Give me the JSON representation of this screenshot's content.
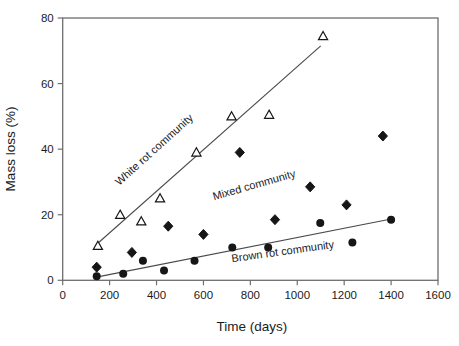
{
  "chart_data": {
    "type": "scatter",
    "title": "",
    "xlabel": "Time (days)",
    "ylabel": "Mass loss (%)",
    "xlim": [
      0,
      1600
    ],
    "ylim": [
      0,
      80
    ],
    "xticks": [
      0,
      200,
      400,
      600,
      800,
      1000,
      1200,
      1400,
      1600
    ],
    "yticks": [
      0,
      20,
      40,
      60,
      80
    ],
    "grid": false,
    "legend_position": "in-plot-rotated-labels",
    "frame_color": "#6e6e6e",
    "marker_color": "#161616",
    "line_color": "#4a4a4a",
    "series": [
      {
        "name": "White rot community",
        "marker": "open-triangle",
        "points": [
          [
            150,
            10.5
          ],
          [
            245,
            20
          ],
          [
            335,
            18
          ],
          [
            415,
            25
          ],
          [
            570,
            39
          ],
          [
            720,
            50
          ],
          [
            880,
            50.5
          ],
          [
            1110,
            74.5
          ]
        ],
        "trendline": [
          [
            145,
            11
          ],
          [
            1100,
            71.5
          ]
        ],
        "label": {
          "text": "White rot community",
          "x": 400,
          "y": 39,
          "rotation": -42
        }
      },
      {
        "name": "Mixed community",
        "marker": "filled-diamond",
        "points": [
          [
            145,
            4
          ],
          [
            295,
            8.5
          ],
          [
            450,
            16.5
          ],
          [
            600,
            14
          ],
          [
            755,
            39
          ],
          [
            905,
            18.5
          ],
          [
            1055,
            28.5
          ],
          [
            1210,
            23
          ],
          [
            1365,
            44
          ]
        ],
        "trendline": null,
        "label": {
          "text": "Mixed community",
          "x": 820,
          "y": 28,
          "rotation": -16
        }
      },
      {
        "name": "Brown rot community",
        "marker": "filled-circle",
        "points": [
          [
            145,
            1.2
          ],
          [
            258,
            2
          ],
          [
            342,
            6
          ],
          [
            432,
            3
          ],
          [
            562,
            6
          ],
          [
            723,
            10
          ],
          [
            876,
            10
          ],
          [
            1098,
            17.5
          ],
          [
            1235,
            11.5
          ],
          [
            1400,
            18.5
          ]
        ],
        "trendline": [
          [
            160,
            1.2
          ],
          [
            1395,
            18.6
          ]
        ],
        "label": {
          "text": "Brown rot community",
          "x": 940,
          "y": 7.7,
          "rotation": -8
        }
      }
    ]
  }
}
